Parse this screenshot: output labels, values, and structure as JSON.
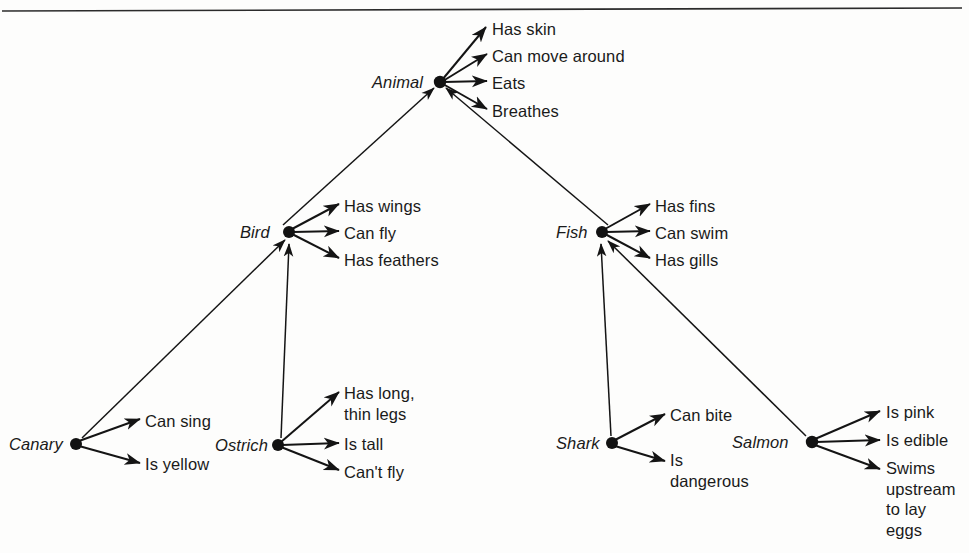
{
  "diagram": {
    "ink_color": "#141414",
    "background_color": "#fdfdfc",
    "rule_color": "#2b2b2b"
  },
  "concepts": {
    "animal": {
      "label": "Animal",
      "x": 440,
      "y": 82
    },
    "bird": {
      "label": "Bird",
      "x": 289,
      "y": 232
    },
    "fish": {
      "label": "Fish",
      "x": 602,
      "y": 232
    },
    "canary": {
      "label": "Canary",
      "x": 76,
      "y": 444
    },
    "ostrich": {
      "label": "Ostrich",
      "x": 278,
      "y": 445
    },
    "shark": {
      "label": "Shark",
      "x": 612,
      "y": 443
    },
    "salmon": {
      "label": "Salmon",
      "x": 812,
      "y": 442
    }
  },
  "properties": {
    "animal": [
      "Has skin",
      "Can move around",
      "Eats",
      "Breathes"
    ],
    "bird": [
      "Has wings",
      "Can fly",
      "Has feathers"
    ],
    "fish": [
      "Has fins",
      "Can swim",
      "Has gills"
    ],
    "canary": [
      "Can sing",
      "Is yellow"
    ],
    "ostrich": [
      "Has long,\nthin legs",
      "Is tall",
      "Can't fly"
    ],
    "shark": [
      "Can bite",
      "Is\ndangerous"
    ],
    "salmon": [
      "Is pink",
      "Is edible",
      "Swims\nupstream\nto lay\neggs"
    ]
  },
  "hierarchy_edges": [
    {
      "from": "bird",
      "to": "animal"
    },
    {
      "from": "fish",
      "to": "animal"
    },
    {
      "from": "canary",
      "to": "bird"
    },
    {
      "from": "ostrich",
      "to": "bird"
    },
    {
      "from": "shark",
      "to": "fish"
    },
    {
      "from": "salmon",
      "to": "fish"
    }
  ]
}
